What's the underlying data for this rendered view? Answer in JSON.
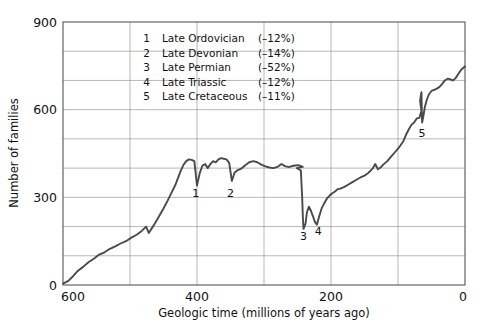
{
  "chart_data": {
    "type": "line",
    "title": "",
    "xlabel": "Geologic time (millions of years ago)",
    "ylabel": "Number of families",
    "xlim": [
      600,
      0
    ],
    "ylim": [
      0,
      900
    ],
    "x_reversed": true,
    "grid": true,
    "xticks": [
      600,
      400,
      200,
      0
    ],
    "xticklabels": [
      "600",
      "400",
      "200",
      "0"
    ],
    "x_gridlines": [
      600,
      500,
      400,
      300,
      200,
      100,
      0
    ],
    "yticks": [
      0,
      300,
      600,
      900
    ],
    "yticklabels": [
      "0",
      "300",
      "600",
      "900"
    ],
    "y_gridlines": [
      0,
      100,
      200,
      300,
      400,
      500,
      600,
      700,
      800,
      900
    ],
    "legend_position": "upper-center",
    "line_color": "#4a4a4a",
    "grid_color": "#9a9a9a",
    "frame_color": "#555555",
    "series": [
      {
        "name": "Number of marine families",
        "points": [
          [
            600,
            5
          ],
          [
            592,
            14
          ],
          [
            585,
            30
          ],
          [
            578,
            48
          ],
          [
            570,
            62
          ],
          [
            562,
            78
          ],
          [
            554,
            90
          ],
          [
            546,
            104
          ],
          [
            538,
            112
          ],
          [
            530,
            124
          ],
          [
            522,
            132
          ],
          [
            514,
            142
          ],
          [
            506,
            150
          ],
          [
            498,
            162
          ],
          [
            490,
            172
          ],
          [
            482,
            186
          ],
          [
            476,
            200
          ],
          [
            472,
            178
          ],
          [
            468,
            192
          ],
          [
            462,
            214
          ],
          [
            456,
            238
          ],
          [
            450,
            262
          ],
          [
            444,
            288
          ],
          [
            438,
            316
          ],
          [
            432,
            344
          ],
          [
            428,
            368
          ],
          [
            424,
            392
          ],
          [
            420,
            412
          ],
          [
            416,
            424
          ],
          [
            412,
            430
          ],
          [
            408,
            428
          ],
          [
            404,
            424
          ],
          [
            400,
            340
          ],
          [
            396,
            382
          ],
          [
            392,
            408
          ],
          [
            388,
            414
          ],
          [
            384,
            400
          ],
          [
            380,
            414
          ],
          [
            376,
            424
          ],
          [
            372,
            420
          ],
          [
            368,
            430
          ],
          [
            364,
            434
          ],
          [
            360,
            432
          ],
          [
            356,
            430
          ],
          [
            352,
            418
          ],
          [
            348,
            356
          ],
          [
            344,
            384
          ],
          [
            340,
            392
          ],
          [
            334,
            398
          ],
          [
            328,
            410
          ],
          [
            322,
            420
          ],
          [
            316,
            424
          ],
          [
            310,
            420
          ],
          [
            304,
            412
          ],
          [
            298,
            406
          ],
          [
            292,
            402
          ],
          [
            286,
            400
          ],
          [
            280,
            404
          ],
          [
            274,
            414
          ],
          [
            268,
            406
          ],
          [
            262,
            404
          ],
          [
            256,
            408
          ],
          [
            250,
            410
          ],
          [
            246,
            408
          ],
          [
            242,
            404
          ],
          [
            251,
            400
          ],
          [
            248,
            396
          ],
          [
            245,
            392
          ],
          [
            243,
            300
          ],
          [
            242,
            230
          ],
          [
            241,
            192
          ],
          [
            238,
            210
          ],
          [
            236,
            248
          ],
          [
            233,
            268
          ],
          [
            230,
            254
          ],
          [
            227,
            236
          ],
          [
            224,
            216
          ],
          [
            221,
            206
          ],
          [
            218,
            232
          ],
          [
            214,
            262
          ],
          [
            210,
            280
          ],
          [
            206,
            296
          ],
          [
            202,
            306
          ],
          [
            198,
            314
          ],
          [
            194,
            320
          ],
          [
            190,
            328
          ],
          [
            186,
            330
          ],
          [
            180,
            336
          ],
          [
            174,
            344
          ],
          [
            168,
            352
          ],
          [
            162,
            360
          ],
          [
            156,
            368
          ],
          [
            150,
            374
          ],
          [
            144,
            384
          ],
          [
            138,
            398
          ],
          [
            134,
            414
          ],
          [
            130,
            396
          ],
          [
            126,
            402
          ],
          [
            122,
            412
          ],
          [
            116,
            424
          ],
          [
            110,
            440
          ],
          [
            104,
            456
          ],
          [
            98,
            472
          ],
          [
            92,
            492
          ],
          [
            88,
            514
          ],
          [
            84,
            532
          ],
          [
            80,
            548
          ],
          [
            76,
            556
          ],
          [
            72,
            570
          ],
          [
            68,
            572
          ],
          [
            65,
            596
          ],
          [
            66,
            612
          ],
          [
            67,
            630
          ],
          [
            66,
            648
          ],
          [
            65,
            660
          ],
          [
            64.5,
            600
          ],
          [
            64,
            556
          ],
          [
            62,
            580
          ],
          [
            60,
            608
          ],
          [
            57,
            634
          ],
          [
            54,
            652
          ],
          [
            50,
            664
          ],
          [
            46,
            668
          ],
          [
            42,
            672
          ],
          [
            38,
            678
          ],
          [
            34,
            688
          ],
          [
            30,
            700
          ],
          [
            26,
            706
          ],
          [
            22,
            704
          ],
          [
            18,
            700
          ],
          [
            14,
            708
          ],
          [
            10,
            722
          ],
          [
            6,
            736
          ],
          [
            2,
            744
          ],
          [
            0,
            748
          ]
        ]
      }
    ],
    "annotations": [
      {
        "label": "1",
        "x": 402,
        "y": 300,
        "event": "Late Ordovician"
      },
      {
        "label": "2",
        "x": 350,
        "y": 300,
        "event": "Late Devonian"
      },
      {
        "label": "3",
        "x": 241,
        "y": 155,
        "event": "Late Permian"
      },
      {
        "label": "4",
        "x": 219,
        "y": 170,
        "event": "Late Triassic"
      },
      {
        "label": "5",
        "x": 64,
        "y": 505,
        "event": "Late Cretaceous"
      }
    ],
    "legend_entries": [
      {
        "number": "1",
        "name": "Late Ordovician",
        "magnitude": "(–12%)"
      },
      {
        "number": "2",
        "name": "Late Devonian",
        "magnitude": "(–14%)"
      },
      {
        "number": "3",
        "name": "Late Permian",
        "magnitude": "(–52%)"
      },
      {
        "number": "4",
        "name": "Late Triassic",
        "magnitude": "(–12%)"
      },
      {
        "number": "5",
        "name": "Late Cretaceous",
        "magnitude": "(–11%)"
      }
    ]
  }
}
